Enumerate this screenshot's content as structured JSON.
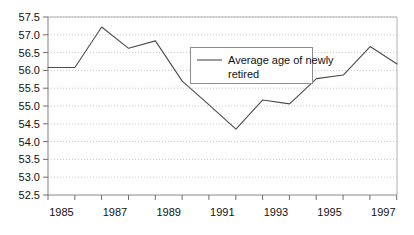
{
  "chart_data": {
    "type": "line",
    "title": "",
    "xlabel": "",
    "ylabel": "",
    "x": [
      1985,
      1986,
      1987,
      1988,
      1989,
      1990,
      1991,
      1992,
      1993,
      1994,
      1995,
      1996,
      1997,
      1998
    ],
    "series": [
      {
        "name": "Average age of newly retired",
        "values": [
          56.08,
          56.08,
          57.22,
          56.62,
          56.83,
          55.7,
          55.03,
          54.35,
          55.17,
          55.06,
          55.77,
          55.87,
          56.67,
          56.18
        ]
      }
    ],
    "xlim": [
      1985,
      1998
    ],
    "ylim": [
      52.5,
      57.5
    ],
    "yticks": [
      52.5,
      53.0,
      53.5,
      54.0,
      54.5,
      55.0,
      55.5,
      56.0,
      56.5,
      57.0,
      57.5
    ],
    "ytick_labels": [
      "52.5",
      "53.0",
      "53.5",
      "54.0",
      "54.5",
      "55.0",
      "55.5",
      "56.0",
      "56.5",
      "57.0",
      "57.5"
    ],
    "xticks": [
      1985,
      1987,
      1989,
      1991,
      1993,
      1995,
      1997
    ],
    "xtick_labels": [
      "1985",
      "1987",
      "1989",
      "1991",
      "1993",
      "1995",
      "1997"
    ],
    "grid": true,
    "grid_axis": "y",
    "legend_position": "inside-upper-center",
    "legend_entries": [
      "Average age of newly retired"
    ],
    "legend_line_1": "Average age of newly",
    "legend_line_2": "retired",
    "colors": {
      "series_line": "#4c4c4c",
      "gridline": "#b9b9b9",
      "axis": "#8a8a8a",
      "text": "#111111",
      "background": "#ffffff",
      "legend_border": "#8d8d8d"
    }
  }
}
